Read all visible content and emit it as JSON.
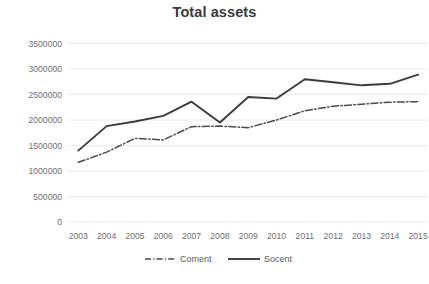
{
  "chart_data": {
    "type": "line",
    "title": "Total assets",
    "xlabel": "",
    "ylabel": "",
    "categories": [
      "2003",
      "2004",
      "2005",
      "2006",
      "2007",
      "2008",
      "2009",
      "2010",
      "2011",
      "2012",
      "2013",
      "2014",
      "2015"
    ],
    "series": [
      {
        "name": "Coment",
        "style": "dash-dot",
        "color": "#4a4a4a",
        "values": [
          1170000,
          1370000,
          1640000,
          1610000,
          1870000,
          1880000,
          1850000,
          2000000,
          2180000,
          2270000,
          2310000,
          2350000,
          2360000
        ]
      },
      {
        "name": "Socent",
        "style": "solid",
        "color": "#3b3b3b",
        "values": [
          1400000,
          1880000,
          1970000,
          2080000,
          2360000,
          1950000,
          2450000,
          2420000,
          2800000,
          2740000,
          2680000,
          2710000,
          2890000
        ]
      }
    ],
    "ylim": [
      0,
      3500000
    ],
    "ytick_values": [
      0,
      500000,
      1000000,
      1500000,
      2000000,
      2500000,
      3000000,
      3500000
    ],
    "ytick_labels": [
      "0",
      "500000",
      "1000000",
      "1500000",
      "2000000",
      "2500000",
      "3000000",
      "3500000"
    ],
    "grid": true,
    "grid_axis": "y",
    "legend_position": "bottom",
    "legend_entries": [
      "Coment",
      "Socent"
    ],
    "colors": {
      "grid": "#e2e2e2",
      "tick_text": "#6e6e6e",
      "title_text": "#3a3a3a",
      "legend_text": "#5a5a5a",
      "background": "#ffffff"
    }
  }
}
